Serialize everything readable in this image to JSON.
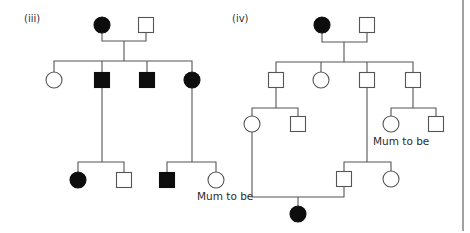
{
  "colors": {
    "background": "#ffffff",
    "line": "#555555",
    "affected": "#0d0d0d",
    "unaffected": "#ffffff"
  },
  "pedigrees": [
    {
      "id": "iii",
      "label": "(iii)",
      "label_pos": [
        24,
        22
      ],
      "individuals": [
        {
          "id": "iii-I-1",
          "sex": "female",
          "affected": true,
          "x": 102,
          "y": 25
        },
        {
          "id": "iii-I-2",
          "sex": "male",
          "affected": false,
          "x": 146,
          "y": 25
        },
        {
          "id": "iii-II-1",
          "sex": "female",
          "affected": false,
          "x": 54,
          "y": 80
        },
        {
          "id": "iii-II-2",
          "sex": "male",
          "affected": true,
          "x": 102,
          "y": 80
        },
        {
          "id": "iii-II-3",
          "sex": "male",
          "affected": true,
          "x": 147,
          "y": 80
        },
        {
          "id": "iii-II-4",
          "sex": "female",
          "affected": true,
          "x": 192,
          "y": 80
        },
        {
          "id": "iii-III-1",
          "sex": "female",
          "affected": true,
          "x": 78,
          "y": 180
        },
        {
          "id": "iii-III-2",
          "sex": "male",
          "affected": false,
          "x": 124,
          "y": 180
        },
        {
          "id": "iii-III-3",
          "sex": "male",
          "affected": true,
          "x": 167,
          "y": 180
        },
        {
          "id": "iii-III-4",
          "sex": "female",
          "affected": false,
          "x": 216,
          "y": 180
        }
      ],
      "lines": [
        [
          [
            102,
            33
          ],
          [
            102,
            41
          ],
          [
            146,
            41
          ],
          [
            146,
            33
          ]
        ],
        [
          [
            124,
            41
          ],
          [
            124,
            61
          ]
        ],
        [
          [
            54,
            72
          ],
          [
            54,
            61
          ],
          [
            192,
            61
          ],
          [
            192,
            72
          ]
        ],
        [
          [
            102,
            61
          ],
          [
            102,
            72
          ]
        ],
        [
          [
            147,
            61
          ],
          [
            147,
            72
          ]
        ],
        [
          [
            102,
            88
          ],
          [
            102,
            162
          ]
        ],
        [
          [
            78,
            172
          ],
          [
            78,
            162
          ],
          [
            124,
            162
          ],
          [
            124,
            172
          ]
        ],
        [
          [
            192,
            88
          ],
          [
            192,
            162
          ]
        ],
        [
          [
            167,
            172
          ],
          [
            167,
            162
          ],
          [
            216,
            162
          ],
          [
            216,
            172
          ]
        ]
      ],
      "annotations": [
        {
          "text": "Mum to be",
          "x": 197,
          "y": 200,
          "anchor": "start"
        }
      ]
    },
    {
      "id": "iv",
      "label": "(iv)",
      "label_pos": [
        232,
        22
      ],
      "individuals": [
        {
          "id": "iv-I-1",
          "sex": "female",
          "affected": true,
          "x": 322,
          "y": 25
        },
        {
          "id": "iv-I-2",
          "sex": "male",
          "affected": false,
          "x": 367,
          "y": 25
        },
        {
          "id": "iv-II-1",
          "sex": "male",
          "affected": false,
          "x": 276,
          "y": 80
        },
        {
          "id": "iv-II-2",
          "sex": "female",
          "affected": false,
          "x": 321,
          "y": 80
        },
        {
          "id": "iv-II-3",
          "sex": "male",
          "affected": false,
          "x": 367,
          "y": 80
        },
        {
          "id": "iv-II-4",
          "sex": "male",
          "affected": false,
          "x": 413,
          "y": 80
        },
        {
          "id": "iv-III-1",
          "sex": "female",
          "affected": false,
          "x": 252,
          "y": 124
        },
        {
          "id": "iv-III-2",
          "sex": "male",
          "affected": false,
          "x": 298,
          "y": 124
        },
        {
          "id": "iv-III-3",
          "sex": "female",
          "affected": false,
          "x": 391,
          "y": 124
        },
        {
          "id": "iv-III-4",
          "sex": "male",
          "affected": false,
          "x": 436,
          "y": 124
        },
        {
          "id": "iv-III-5",
          "sex": "male",
          "affected": false,
          "x": 344,
          "y": 179
        },
        {
          "id": "iv-III-6",
          "sex": "female",
          "affected": false,
          "x": 391,
          "y": 179
        },
        {
          "id": "iv-IV-1",
          "sex": "female",
          "affected": true,
          "x": 298,
          "y": 214
        }
      ],
      "lines": [
        [
          [
            322,
            33
          ],
          [
            322,
            42
          ],
          [
            367,
            42
          ],
          [
            367,
            33
          ]
        ],
        [
          [
            344,
            42
          ],
          [
            344,
            62
          ]
        ],
        [
          [
            276,
            72
          ],
          [
            276,
            62
          ],
          [
            413,
            62
          ],
          [
            413,
            72
          ]
        ],
        [
          [
            321,
            62
          ],
          [
            321,
            72
          ]
        ],
        [
          [
            367,
            62
          ],
          [
            367,
            72
          ]
        ],
        [
          [
            276,
            88
          ],
          [
            276,
            108
          ]
        ],
        [
          [
            252,
            116
          ],
          [
            252,
            108
          ],
          [
            298,
            108
          ],
          [
            298,
            116
          ]
        ],
        [
          [
            413,
            88
          ],
          [
            413,
            108
          ]
        ],
        [
          [
            391,
            116
          ],
          [
            391,
            108
          ],
          [
            436,
            108
          ],
          [
            436,
            116
          ]
        ],
        [
          [
            367,
            88
          ],
          [
            367,
            162
          ]
        ],
        [
          [
            344,
            171
          ],
          [
            344,
            162
          ],
          [
            391,
            162
          ],
          [
            391,
            171
          ]
        ],
        [
          [
            252,
            132
          ],
          [
            252,
            197
          ],
          [
            344,
            197
          ],
          [
            344,
            187
          ]
        ],
        [
          [
            298,
            197
          ],
          [
            298,
            206
          ]
        ]
      ],
      "annotations": [
        {
          "text": "Mum to be",
          "x": 373,
          "y": 145,
          "anchor": "start"
        }
      ]
    }
  ],
  "border": {
    "x": 463,
    "y1": 0,
    "y2": 231
  }
}
